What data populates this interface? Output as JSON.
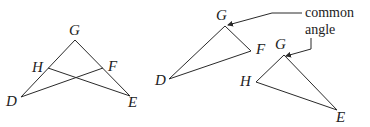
{
  "figures": {
    "left": {
      "description": "Two overlapping triangles GDF and GHE sharing angle G",
      "vertices": {
        "G": {
          "label": "G",
          "x": 75,
          "y": 40
        },
        "H": {
          "label": "H",
          "x": 48,
          "y": 68
        },
        "F": {
          "label": "F",
          "x": 103,
          "y": 68
        },
        "D": {
          "label": "D",
          "x": 21,
          "y": 97
        },
        "E": {
          "label": "E",
          "x": 130,
          "y": 96
        }
      }
    },
    "right_top": {
      "description": "Triangle DGF",
      "vertices": {
        "G": {
          "label": "G",
          "x": 225,
          "y": 26
        },
        "F": {
          "label": "F",
          "x": 251,
          "y": 51
        },
        "D": {
          "label": "D",
          "x": 169,
          "y": 79
        }
      }
    },
    "right_bottom": {
      "description": "Triangle HGE",
      "vertices": {
        "G": {
          "label": "G",
          "x": 284,
          "y": 55
        },
        "H": {
          "label": "H",
          "x": 256,
          "y": 82
        },
        "E": {
          "label": "E",
          "x": 337,
          "y": 110
        }
      }
    }
  },
  "annotation": {
    "line1": "common",
    "line2": "angle"
  },
  "colors": {
    "stroke": "#2a2a2a",
    "text": "#222222",
    "background": "#ffffff"
  }
}
